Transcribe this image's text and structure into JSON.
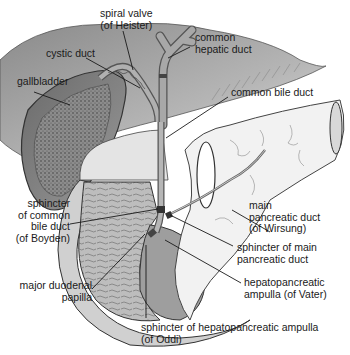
{
  "figure": {
    "colors": {
      "liver": "#7a7a7a",
      "liver_light": "#d6d6d6",
      "duct": "#9c9c9c",
      "duodenum": "#bdbdbd",
      "pancreas": "#f1f1f1",
      "outline": "#333333",
      "leader_line": "#1a1a1a"
    },
    "labels": {
      "spiral_valve": [
        "spiral valve",
        "(of Heister)"
      ],
      "common_hepatic_duct": [
        "common",
        "hepatic duct"
      ],
      "cystic_duct": [
        "cystic duct"
      ],
      "gallbladder": [
        "gallbladder"
      ],
      "common_bile_duct": [
        "common bile duct"
      ],
      "sphincter_common_bile_duct": [
        "sphincter",
        "of common",
        "bile duct",
        "(of Boyden)"
      ],
      "main_pancreatic_duct": [
        "main",
        "pancreatic duct",
        "(of Wirsung)"
      ],
      "sphincter_main_pancreatic_duct": [
        "sphincter of main",
        "pancreatic duct"
      ],
      "major_duodenal_papilla": [
        "major duodenal",
        "papilla"
      ],
      "hepatopancreatic_ampulla": [
        "hepatopancreatic",
        "ampulla (of Vater)"
      ],
      "sphincter_hepatopancreatic_ampulla": [
        "sphincter of hepatopancreatic ampulla",
        "(of Oddi)"
      ]
    }
  }
}
